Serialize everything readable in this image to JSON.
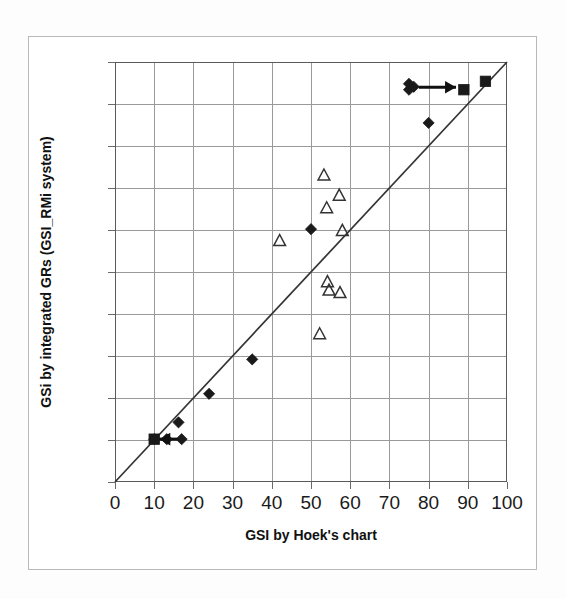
{
  "chart_data": {
    "type": "scatter",
    "title": "",
    "xlabel": "GSI by Hoek's chart",
    "ylabel": "GSi by integrated GRs (GSI_RMi system)",
    "xlim": [
      0,
      100
    ],
    "ylim": [
      0,
      100
    ],
    "xticks": [
      0,
      10,
      20,
      30,
      40,
      50,
      60,
      70,
      80,
      90,
      100
    ],
    "yticks": [
      0,
      10,
      20,
      30,
      40,
      50,
      60,
      70,
      80,
      90,
      100
    ],
    "xtick_labels": [
      "0",
      "10",
      "20",
      "30",
      "40",
      "50",
      "60",
      "70",
      "80",
      "90",
      "100"
    ],
    "ytick_labels": [
      "0",
      "10",
      "20",
      "30",
      "40",
      "50",
      "60",
      "70",
      "80",
      "90",
      "100"
    ],
    "grid": true,
    "legend": "none",
    "series": [
      {
        "name": "filled-diamond",
        "marker": "diamond",
        "fill": "#1a1a1a",
        "points": [
          {
            "x": 10.0,
            "y": 10.2
          },
          {
            "x": 13.2,
            "y": 10.2
          },
          {
            "x": 17.0,
            "y": 10.2
          },
          {
            "x": 16.2,
            "y": 14.2
          },
          {
            "x": 24.0,
            "y": 21.0
          },
          {
            "x": 35.0,
            "y": 29.2
          },
          {
            "x": 50.0,
            "y": 60.2
          },
          {
            "x": 75.0,
            "y": 94.8
          },
          {
            "x": 75.0,
            "y": 93.4
          },
          {
            "x": 76.2,
            "y": 94.1
          },
          {
            "x": 80.0,
            "y": 85.5
          }
        ]
      },
      {
        "name": "filled-square",
        "marker": "square",
        "fill": "#1a1a1a",
        "points": [
          {
            "x": 10.0,
            "y": 10.2
          },
          {
            "x": 89.0,
            "y": 93.4
          },
          {
            "x": 94.5,
            "y": 95.4
          }
        ]
      },
      {
        "name": "open-triangle",
        "marker": "triangle",
        "fill": "none",
        "stroke": "#333333",
        "points": [
          {
            "x": 42.0,
            "y": 57.4
          },
          {
            "x": 52.2,
            "y": 35.2
          },
          {
            "x": 53.3,
            "y": 73.0
          },
          {
            "x": 54.0,
            "y": 65.2
          },
          {
            "x": 54.2,
            "y": 47.6
          },
          {
            "x": 54.6,
            "y": 45.6
          },
          {
            "x": 57.2,
            "y": 68.2
          },
          {
            "x": 57.4,
            "y": 45.0
          },
          {
            "x": 58.0,
            "y": 59.8
          }
        ]
      }
    ],
    "reference_line": {
      "name": "one-to-one-line",
      "from": {
        "x": 0,
        "y": 0
      },
      "to": {
        "x": 100,
        "y": 100
      },
      "color": "#333333"
    },
    "annotations": [
      {
        "name": "right-arrow-high",
        "type": "arrow",
        "from": {
          "x": 77.5,
          "y": 94.0
        },
        "to": {
          "x": 87.0,
          "y": 94.0
        },
        "color": "#111111"
      },
      {
        "name": "left-arrow-low",
        "type": "arrow",
        "from": {
          "x": 16.0,
          "y": 10.2
        },
        "to": {
          "x": 11.3,
          "y": 10.2
        },
        "color": "#111111"
      }
    ]
  },
  "colors": {
    "marker": "#1a1a1a",
    "grid": "#9a9a9a",
    "axis": "#5a5a5a",
    "frame": "#b9b9b9",
    "background": "#ffffff"
  }
}
